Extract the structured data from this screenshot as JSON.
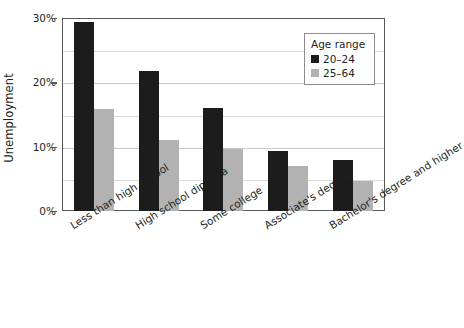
{
  "chart_data": {
    "type": "bar",
    "title": "",
    "xlabel": "",
    "ylabel": "Unemployment",
    "categories": [
      "Less than high school",
      "High school diploma",
      "Some college",
      "Associate's degree",
      "Bachelor's degree and higher"
    ],
    "series": [
      {
        "name": "20–24",
        "color": "#1c1c1c",
        "values": [
          29.4,
          21.8,
          16.0,
          9.4,
          7.9
        ]
      },
      {
        "name": "25–64",
        "color": "#b2b2b2",
        "values": [
          15.8,
          11.0,
          9.6,
          7.0,
          4.6
        ]
      }
    ],
    "ylim": [
      0,
      30
    ],
    "ytick_values": [
      0,
      10,
      20,
      30
    ],
    "ytick_labels": [
      "0%",
      "10%",
      "20%",
      "30%"
    ],
    "minor_gridline_values": [
      5,
      15,
      25
    ],
    "grid": true,
    "legend_position": "top-right",
    "legend_title": "Age range",
    "value_suffix": "%"
  },
  "legend": {
    "title": "Age range",
    "entries": [
      {
        "label": "20–24",
        "color": "#1c1c1c"
      },
      {
        "label": "25–64",
        "color": "#b2b2b2"
      }
    ]
  },
  "axes": {
    "y_title": "Unemployment",
    "y_ticks": [
      "0%",
      "10%",
      "20%",
      "30%"
    ],
    "x_ticks": [
      "Less than high school",
      "High school diploma",
      "Some college",
      "Associate's degree",
      "Bachelor's degree and higher"
    ]
  }
}
